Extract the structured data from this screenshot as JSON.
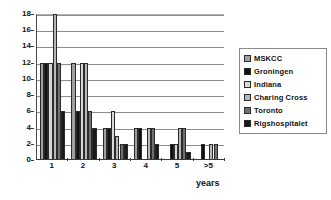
{
  "chart_data": {
    "type": "bar",
    "title": "",
    "xlabel": "years",
    "ylabel": "",
    "categories": [
      "1",
      "2",
      "3",
      "4",
      "5",
      ">5"
    ],
    "ylim": [
      0,
      18
    ],
    "yticks": [
      0,
      2,
      4,
      6,
      8,
      10,
      12,
      14,
      16,
      18
    ],
    "grid": true,
    "legend_position": "right",
    "series": [
      {
        "name": "MSKCC",
        "color": "#a0a0a0",
        "values": [
          12,
          12,
          4,
          4,
          0,
          0
        ]
      },
      {
        "name": "Groningen",
        "color": "#111111",
        "values": [
          12,
          6,
          4,
          4,
          2,
          2
        ]
      },
      {
        "name": "Indiana",
        "color": "#d8d8d8",
        "values": [
          12,
          12,
          6,
          0,
          2,
          0
        ]
      },
      {
        "name": "Charing Cross",
        "color": "#b8b8b8",
        "values": [
          18,
          12,
          3,
          4,
          4,
          2
        ]
      },
      {
        "name": "Toronto",
        "color": "#707070",
        "values": [
          12,
          6,
          2,
          4,
          4,
          2
        ]
      },
      {
        "name": "Rigshospitalet",
        "color": "#1a1a1a",
        "values": [
          6,
          4,
          2,
          2,
          1,
          0
        ]
      }
    ]
  },
  "axis": {
    "y_tick_labels": [
      "0",
      "2",
      "4",
      "6",
      "8",
      "10",
      "12",
      "14",
      "16",
      "18"
    ],
    "x_tick_labels": [
      "1",
      "2",
      "3",
      "4",
      "5",
      ">5"
    ],
    "x_title": "years"
  },
  "legend": {
    "items": [
      {
        "label": "MSKCC"
      },
      {
        "label": "Groningen"
      },
      {
        "label": "Indiana"
      },
      {
        "label": "Charing Cross"
      },
      {
        "label": "Toronto"
      },
      {
        "label": "Rigshospitalet"
      }
    ]
  }
}
